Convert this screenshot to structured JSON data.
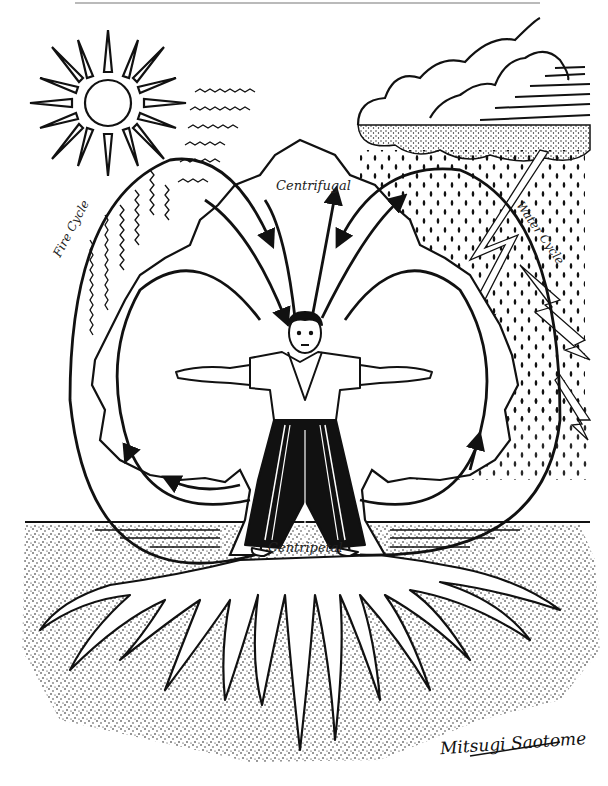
{
  "diagram": {
    "labels": {
      "top": "Centrifugal",
      "bottom": "Centripetal",
      "left_cycle": "Fire Cycle",
      "right_cycle": "Water Cycle"
    },
    "signature": "Mitsugi Saotome",
    "elements": [
      "sun",
      "heat-waves",
      "rain-cloud",
      "rain-drops",
      "lightning",
      "tree-crown",
      "human-figure",
      "ground",
      "roots",
      "cycle-arrows"
    ],
    "colors": {
      "ink": "#111111",
      "paper": "#ffffff"
    }
  }
}
